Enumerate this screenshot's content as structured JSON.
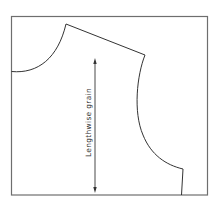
{
  "diagram": {
    "grain_label": "Lengthwise grain",
    "colors": {
      "background": "#ffffff",
      "frame": "#6e6e6e",
      "pattern_line": "#333333",
      "text": "#333333"
    }
  }
}
